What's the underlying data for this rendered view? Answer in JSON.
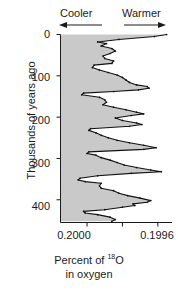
{
  "annotations": {
    "cooler": "Cooler",
    "warmer": "Warmer",
    "cooler_arrow": "left-arrow",
    "warmer_arrow": "right-arrow"
  },
  "axes": {
    "y_title": "Thousands of years ago",
    "x_title_line1_prefix": "Percent of ",
    "x_title_line1_sup": "18",
    "x_title_line1_suffix": "O",
    "x_title_line2": "in oxygen",
    "y_ticks": [
      "0",
      "100",
      "200",
      "300",
      "400"
    ],
    "x_ticks": [
      "0.2000",
      "",
      "0.1996"
    ]
  },
  "style": {
    "fill_color": "#c9c9c9",
    "line_color": "#111111",
    "axis_color": "#1a1a1a",
    "background": "#ffffff"
  },
  "chart_data": {
    "type": "line",
    "title": "",
    "subtitle": "",
    "xlabel": "Percent of 18O in oxygen",
    "ylabel": "Thousands of years ago",
    "orientation": "vertical-depth",
    "xlim": [
      0.20015,
      0.19952
    ],
    "ylim": [
      0,
      455
    ],
    "x_tick_values": [
      0.2,
      0.1998,
      0.1996
    ],
    "y_tick_values": [
      0,
      100,
      200,
      300,
      400
    ],
    "grid": false,
    "legend": null,
    "direction_low_x": "Cooler",
    "direction_high_x": "Warmer",
    "series": [
      {
        "name": "Percent 18O",
        "x_key": "percent_18O",
        "y_key": "age_ka",
        "age_ka": [
          0,
          5,
          12,
          18,
          22,
          28,
          34,
          40,
          46,
          52,
          58,
          64,
          70,
          74,
          80,
          86,
          92,
          98,
          104,
          110,
          116,
          122,
          126,
          130,
          134,
          138,
          142,
          146,
          152,
          158,
          164,
          170,
          176,
          182,
          188,
          192,
          196,
          202,
          208,
          214,
          218,
          222,
          228,
          232,
          238,
          244,
          250,
          256,
          262,
          268,
          274,
          278,
          284,
          288,
          292,
          298,
          304,
          310,
          316,
          322,
          328,
          332,
          336,
          342,
          348,
          352,
          356,
          360,
          366,
          372,
          378,
          384,
          390,
          396,
          402,
          406,
          410,
          414,
          418,
          424,
          428,
          432,
          436,
          442,
          448,
          452
        ],
        "percent_18O": [
          0.19955,
          0.19962,
          0.19982,
          0.19994,
          0.19989,
          0.19992,
          0.19986,
          0.19984,
          0.19987,
          0.19991,
          0.1999,
          0.19985,
          0.19986,
          0.19996,
          0.19997,
          0.19993,
          0.19988,
          0.19983,
          0.1998,
          0.19978,
          0.19976,
          0.19972,
          0.19966,
          0.19965,
          0.19971,
          0.19985,
          0.20002,
          0.20003,
          0.19993,
          0.1999,
          0.19989,
          0.19991,
          0.19985,
          0.19978,
          0.19972,
          0.19968,
          0.19975,
          0.19984,
          0.1998,
          0.19972,
          0.19969,
          0.19976,
          0.19998,
          0.19999,
          0.19995,
          0.19992,
          0.19988,
          0.19983,
          0.19976,
          0.19968,
          0.19961,
          0.19968,
          0.19999,
          0.2,
          0.19995,
          0.19992,
          0.19987,
          0.19983,
          0.19979,
          0.19972,
          0.19964,
          0.19958,
          0.19975,
          0.19994,
          0.20004,
          0.20005,
          0.20001,
          0.19992,
          0.19993,
          0.19992,
          0.19985,
          0.19982,
          0.19977,
          0.1997,
          0.19964,
          0.19966,
          0.19974,
          0.19973,
          0.1998,
          0.1999,
          0.20002,
          0.20001,
          0.19994,
          0.19987,
          0.19984,
          0.19986
        ]
      }
    ]
  }
}
